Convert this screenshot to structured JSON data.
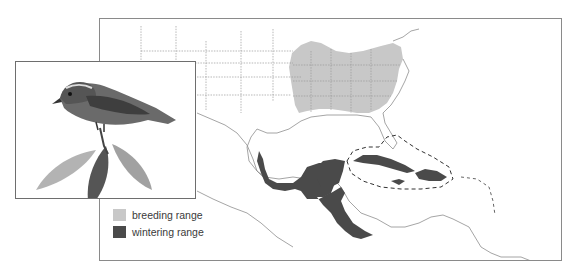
{
  "figure": {
    "region": "Eastern North America, Central America and the Caribbean"
  },
  "legend": {
    "items": [
      {
        "label": "breeding range",
        "color": "#c8c8c8",
        "icon": "breeding-range-swatch"
      },
      {
        "label": "wintering range",
        "color": "#4a4a4a",
        "icon": "wintering-range-swatch"
      }
    ]
  },
  "colors": {
    "breeding": "#c8c8c8",
    "wintering": "#4a4a4a",
    "borders": "#9a9a9a",
    "frame": "#8a8a8a"
  },
  "illustration": {
    "description": "pen-and-ink drawing of a warbler perched on a leafy twig"
  }
}
